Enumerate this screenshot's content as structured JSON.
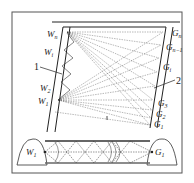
{
  "diagram": {
    "left_labels": [
      {
        "base": "W",
        "sub": "n"
      },
      {
        "base": "W",
        "sub": "i"
      },
      {
        "base": "W",
        "sub": "2"
      },
      {
        "base": "W",
        "sub": "1"
      }
    ],
    "right_labels": [
      {
        "base": "G",
        "sub": "n"
      },
      {
        "base": "G",
        "sub": "n−1"
      },
      {
        "base": "G",
        "sub": "i"
      },
      {
        "base": "G",
        "sub": "3"
      },
      {
        "base": "G",
        "sub": "2"
      },
      {
        "base": "G",
        "sub": "1"
      }
    ],
    "callouts": {
      "left": "1",
      "right": "2",
      "middle": "i"
    },
    "bottom": {
      "left_label": {
        "base": "W",
        "sub": "1"
      },
      "right_label": {
        "base": "G",
        "sub": "1"
      }
    },
    "colors": {
      "line": "#222222",
      "border": "#444444",
      "bg": "#ffffff"
    }
  }
}
